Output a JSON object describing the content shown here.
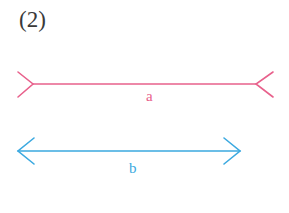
{
  "figure": {
    "number_label": "(2)",
    "colors": {
      "line_a": "#e8618c",
      "line_b": "#3ba9e0",
      "text": "#3a3a3a"
    },
    "segments": [
      {
        "name": "a",
        "label": "a",
        "style": "fins-outward (Müller-Lyer tail ends)",
        "x1": 33,
        "x2": 256,
        "y": 84
      },
      {
        "name": "b",
        "label": "b",
        "style": "arrowheads (Müller-Lyer arrow ends)",
        "x1": 18,
        "x2": 240,
        "y": 151
      }
    ]
  }
}
